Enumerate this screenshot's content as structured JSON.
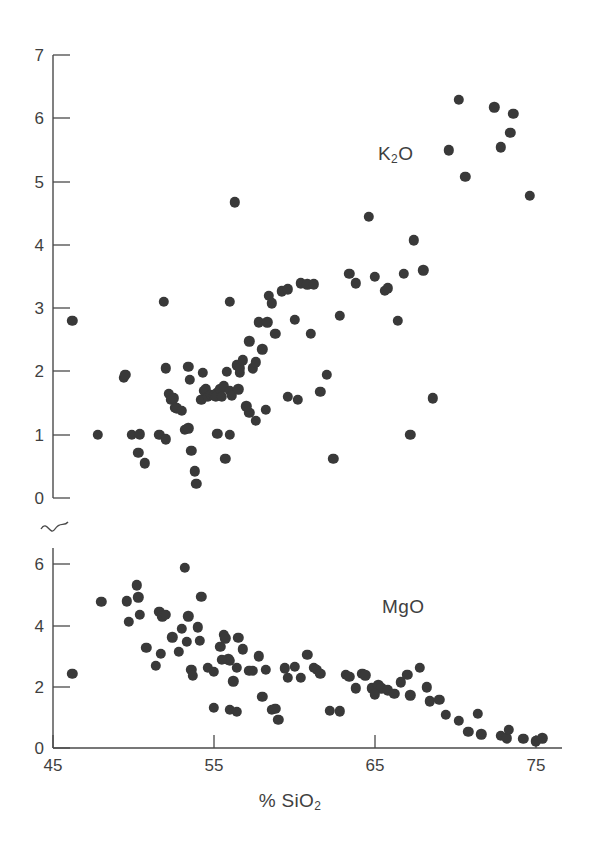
{
  "figure": {
    "background": "#ffffff",
    "ink_color": "#3f3f3f",
    "marker_color": "#393939"
  },
  "axis": {
    "x_title_main": "% SiO",
    "x_title_sub": "2",
    "x_ticks": [
      45,
      55,
      65,
      75
    ],
    "x_tick_labels": [
      "45",
      "55",
      "65",
      "75"
    ],
    "upper_y_ticks": [
      0,
      1,
      2,
      3,
      4,
      5,
      6,
      7
    ],
    "upper_y_tick_labels": [
      "0",
      "1",
      "2",
      "3",
      "4",
      "5",
      "6",
      "7"
    ],
    "lower_y_ticks": [
      0,
      2,
      4,
      6
    ],
    "lower_y_tick_labels": [
      "0",
      "2",
      "4",
      "6"
    ],
    "break_symbol": "axis-break-squiggle"
  },
  "labels": {
    "upper_series_main": "K",
    "upper_series_sub": "2",
    "upper_series_tail": "O",
    "lower_series": "MgO"
  },
  "chart_data": [
    {
      "type": "scatter",
      "name": "K2O",
      "title": "K₂O vs % SiO₂",
      "xlabel": "% SiO2",
      "ylabel": "K2O",
      "xlim": [
        45,
        76.5
      ],
      "ylim": [
        0,
        7
      ],
      "grid": false,
      "legend": "none",
      "annotation": "K2O",
      "points": [
        [
          46.2,
          2.8
        ],
        [
          47.8,
          1.0
        ],
        [
          49.4,
          1.9
        ],
        [
          49.5,
          1.95
        ],
        [
          49.9,
          1.0
        ],
        [
          50.4,
          1.01
        ],
        [
          50.3,
          0.72
        ],
        [
          50.7,
          0.55
        ],
        [
          51.6,
          1.0
        ],
        [
          52.0,
          0.93
        ],
        [
          52.2,
          1.65
        ],
        [
          52.3,
          1.55
        ],
        [
          52.5,
          1.58
        ],
        [
          52.0,
          2.05
        ],
        [
          52.6,
          1.43
        ],
        [
          52.7,
          1.42
        ],
        [
          53.4,
          2.08
        ],
        [
          53.5,
          1.87
        ],
        [
          53.0,
          1.38
        ],
        [
          53.2,
          1.08
        ],
        [
          53.4,
          1.1
        ],
        [
          53.6,
          0.75
        ],
        [
          53.8,
          0.42
        ],
        [
          53.9,
          0.22
        ],
        [
          54.2,
          1.55
        ],
        [
          54.4,
          1.7
        ],
        [
          54.3,
          1.98
        ],
        [
          54.5,
          1.72
        ],
        [
          54.6,
          1.6
        ],
        [
          54.8,
          1.63
        ],
        [
          55.0,
          1.62
        ],
        [
          55.2,
          1.66
        ],
        [
          55.1,
          1.6
        ],
        [
          55.4,
          1.72
        ],
        [
          55.6,
          1.78
        ],
        [
          55.5,
          1.6
        ],
        [
          55.8,
          2.0
        ],
        [
          56.0,
          1.7
        ],
        [
          56.1,
          1.62
        ],
        [
          56.4,
          2.1
        ],
        [
          56.6,
          1.98
        ],
        [
          56.6,
          2.05
        ],
        [
          56.5,
          1.72
        ],
        [
          56.8,
          2.18
        ],
        [
          56.3,
          4.68
        ],
        [
          56.0,
          3.1
        ],
        [
          51.9,
          3.1
        ],
        [
          57.2,
          2.48
        ],
        [
          57.4,
          2.05
        ],
        [
          57.6,
          2.15
        ],
        [
          57.8,
          2.78
        ],
        [
          58.0,
          2.35
        ],
        [
          58.4,
          3.2
        ],
        [
          58.6,
          3.08
        ],
        [
          58.3,
          2.78
        ],
        [
          58.8,
          2.6
        ],
        [
          59.2,
          3.27
        ],
        [
          59.6,
          3.3
        ],
        [
          60.0,
          2.82
        ],
        [
          60.4,
          3.4
        ],
        [
          60.8,
          3.38
        ],
        [
          61.2,
          3.38
        ],
        [
          61.0,
          2.6
        ],
        [
          57.2,
          1.35
        ],
        [
          57.6,
          1.22
        ],
        [
          58.2,
          1.4
        ],
        [
          55.2,
          1.02
        ],
        [
          56.0,
          1.0
        ],
        [
          57.0,
          1.45
        ],
        [
          55.7,
          0.62
        ],
        [
          59.6,
          1.6
        ],
        [
          60.2,
          1.55
        ],
        [
          61.6,
          1.68
        ],
        [
          62.4,
          0.62
        ],
        [
          62.0,
          1.95
        ],
        [
          62.8,
          2.88
        ],
        [
          63.4,
          3.55
        ],
        [
          63.8,
          3.4
        ],
        [
          64.6,
          4.45
        ],
        [
          65.0,
          3.5
        ],
        [
          65.6,
          3.28
        ],
        [
          65.8,
          3.32
        ],
        [
          66.4,
          2.8
        ],
        [
          66.8,
          3.55
        ],
        [
          67.4,
          4.08
        ],
        [
          67.2,
          1.0
        ],
        [
          68.0,
          3.6
        ],
        [
          68.6,
          1.58
        ],
        [
          69.6,
          5.5
        ],
        [
          70.2,
          6.3
        ],
        [
          70.6,
          5.08
        ],
        [
          72.4,
          6.18
        ],
        [
          72.8,
          5.55
        ],
        [
          73.6,
          6.08
        ],
        [
          73.4,
          5.78
        ],
        [
          74.6,
          4.78
        ]
      ]
    },
    {
      "type": "scatter",
      "name": "MgO",
      "title": "MgO vs % SiO₂",
      "xlabel": "% SiO2",
      "ylabel": "MgO",
      "xlim": [
        45,
        76.5
      ],
      "ylim": [
        0,
        6.6
      ],
      "grid": false,
      "legend": "none",
      "annotation": "MgO",
      "points": [
        [
          46.2,
          2.42
        ],
        [
          48.0,
          4.78
        ],
        [
          49.6,
          4.8
        ],
        [
          49.7,
          4.12
        ],
        [
          50.2,
          5.32
        ],
        [
          50.3,
          4.92
        ],
        [
          50.4,
          4.35
        ],
        [
          50.8,
          3.28
        ],
        [
          51.6,
          4.45
        ],
        [
          51.8,
          4.3
        ],
        [
          52.0,
          4.35
        ],
        [
          51.7,
          3.08
        ],
        [
          51.4,
          2.68
        ],
        [
          52.4,
          3.62
        ],
        [
          53.2,
          5.88
        ],
        [
          53.0,
          3.9
        ],
        [
          52.8,
          3.15
        ],
        [
          53.4,
          4.3
        ],
        [
          53.3,
          3.48
        ],
        [
          53.6,
          2.55
        ],
        [
          53.7,
          2.35
        ],
        [
          54.2,
          4.95
        ],
        [
          54.0,
          3.95
        ],
        [
          54.1,
          3.5
        ],
        [
          54.6,
          2.62
        ],
        [
          55.0,
          2.5
        ],
        [
          55.4,
          3.3
        ],
        [
          55.6,
          3.7
        ],
        [
          55.7,
          3.58
        ],
        [
          55.9,
          2.9
        ],
        [
          56.0,
          2.85
        ],
        [
          56.2,
          2.18
        ],
        [
          55.5,
          2.88
        ],
        [
          56.5,
          3.6
        ],
        [
          56.8,
          3.22
        ],
        [
          56.4,
          2.62
        ],
        [
          57.2,
          2.52
        ],
        [
          57.4,
          2.52
        ],
        [
          55.0,
          1.32
        ],
        [
          56.0,
          1.25
        ],
        [
          56.4,
          1.18
        ],
        [
          57.8,
          3.0
        ],
        [
          58.2,
          2.55
        ],
        [
          58.0,
          1.68
        ],
        [
          58.6,
          1.25
        ],
        [
          58.8,
          1.28
        ],
        [
          59.0,
          0.92
        ],
        [
          59.4,
          2.6
        ],
        [
          59.6,
          2.3
        ],
        [
          60.0,
          2.65
        ],
        [
          60.4,
          2.3
        ],
        [
          60.8,
          3.05
        ],
        [
          61.2,
          2.62
        ],
        [
          61.4,
          2.55
        ],
        [
          61.6,
          2.42
        ],
        [
          62.2,
          1.22
        ],
        [
          62.8,
          1.2
        ],
        [
          63.2,
          2.4
        ],
        [
          63.4,
          2.32
        ],
        [
          63.8,
          1.95
        ],
        [
          64.2,
          2.42
        ],
        [
          64.4,
          2.38
        ],
        [
          64.8,
          1.95
        ],
        [
          65.2,
          2.05
        ],
        [
          65.4,
          1.95
        ],
        [
          65.0,
          1.75
        ],
        [
          65.8,
          1.88
        ],
        [
          66.2,
          1.78
        ],
        [
          66.6,
          2.15
        ],
        [
          67.0,
          2.4
        ],
        [
          67.2,
          1.72
        ],
        [
          67.8,
          2.62
        ],
        [
          68.2,
          1.98
        ],
        [
          68.4,
          1.52
        ],
        [
          69.0,
          1.58
        ],
        [
          69.4,
          1.08
        ],
        [
          70.2,
          0.88
        ],
        [
          70.8,
          0.52
        ],
        [
          71.4,
          1.12
        ],
        [
          71.6,
          0.45
        ],
        [
          72.8,
          0.4
        ],
        [
          73.2,
          0.32
        ],
        [
          73.3,
          0.6
        ],
        [
          74.2,
          0.3
        ],
        [
          75.0,
          0.22
        ],
        [
          75.4,
          0.32
        ]
      ]
    }
  ],
  "geometry": {
    "x_axis_px": {
      "x_at_45": 53,
      "px_per_unit": 16.1
    },
    "upper_y_px": {
      "y_at_0": 498,
      "px_per_unit": 63.2
    },
    "lower_y_px": {
      "y_at_0": 748,
      "px_per_unit": 30.6
    },
    "marker_radius_px": 5.2,
    "axis_x_left_px": 53,
    "axis_x_right_px": 560,
    "upper_axis_top_px": 55,
    "break_y_px": 528
  }
}
